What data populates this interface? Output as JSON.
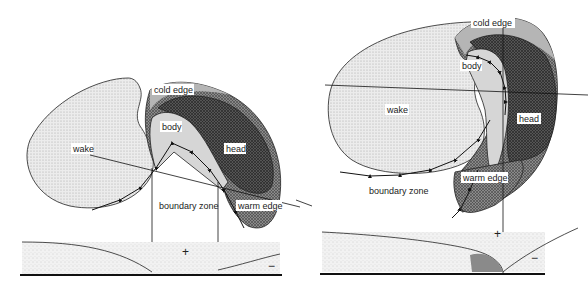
{
  "figure": {
    "panels": [
      {
        "id": "left",
        "labels": {
          "cold_edge": "cold edge",
          "body": "body",
          "head": "head",
          "wake": "wake",
          "boundary_zone": "boundary zone",
          "warm_edge": "warm edge",
          "plus": "+",
          "minus": "−"
        }
      },
      {
        "id": "right",
        "labels": {
          "cold_edge": "cold edge",
          "body": "body",
          "head": "head",
          "wake": "wake",
          "boundary_zone": "boundary zone",
          "warm_edge": "warm edge",
          "plus": "+",
          "minus": "−"
        }
      }
    ],
    "colors": {
      "wake_fill": "#e6e6e6",
      "cold_edge_fill": "#b9b9b9",
      "body_fill": "#d2d2d2",
      "head_left_fill": "#3a3a3a",
      "head_right_fill": "#6a6a6a",
      "warm_edge_fill": "#9a9a9a",
      "line": "#222222",
      "ground": "#111111"
    }
  }
}
